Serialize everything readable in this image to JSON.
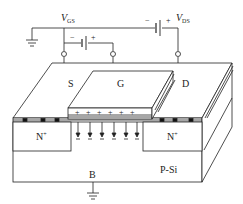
{
  "diagram": {
    "colors": {
      "line": "#222222",
      "background": "#ffffff",
      "contact": "#111111"
    },
    "sources": {
      "vgs": {
        "label": "V",
        "sub": "GS",
        "neg": "−",
        "pos": "+"
      },
      "vds": {
        "label": "V",
        "sub": "DS",
        "neg": "−",
        "pos": "+"
      }
    },
    "terminals": {
      "source": "S",
      "gate": "G",
      "drain": "D",
      "body": "B"
    },
    "regions": {
      "left_doped": {
        "label": "N",
        "sup": "+"
      },
      "right_doped": {
        "label": "N",
        "sup": "+"
      },
      "substrate": "P-Si"
    },
    "field": {
      "charge_sign": "+",
      "charge_count": 6,
      "arrow_count": 6,
      "direction": "down"
    },
    "grounds": [
      "ground-top-left",
      "ground-body"
    ]
  }
}
